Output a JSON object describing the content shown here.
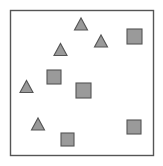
{
  "figure": {
    "title": "",
    "background_color": "#ffffff",
    "width": 163,
    "height": 166
  },
  "frame": {
    "name": "plot-border",
    "x": 10.5,
    "y": 10.5,
    "width": 143,
    "height": 145,
    "stroke_color": "#555555",
    "stroke_width": 1.4,
    "fill_color": "#ffffff"
  },
  "style": {
    "shape_fill": "#9a9a9a",
    "shape_stroke": "#555555",
    "shape_stroke_width": 1.1
  },
  "chart_data": {
    "type": "scatter",
    "title": "",
    "subtitle": "",
    "xlabel": "",
    "ylabel": "",
    "xlim": [
      10,
      154
    ],
    "ylim": [
      10,
      156
    ],
    "grid": false,
    "legend": "none",
    "axis_ticks": false,
    "axis_tick_labels": [],
    "annotations": [],
    "series": [
      {
        "name": "triangles",
        "marker": "triangle",
        "fill_color": "#9a9a9a",
        "edge_color": "#555555",
        "count": 5,
        "points": [
          {
            "id": "triangle-1",
            "cx": 81,
            "cy": 24,
            "size": 13
          },
          {
            "id": "triangle-2",
            "cx": 101,
            "cy": 41,
            "size": 13
          },
          {
            "id": "triangle-3",
            "cx": 60.5,
            "cy": 49.5,
            "size": 13
          },
          {
            "id": "triangle-4",
            "cx": 26.5,
            "cy": 86.5,
            "size": 13
          },
          {
            "id": "triangle-5",
            "cx": 38,
            "cy": 124,
            "size": 13
          }
        ]
      },
      {
        "name": "squares",
        "marker": "square",
        "fill_color": "#9a9a9a",
        "edge_color": "#555555",
        "count": 6,
        "points": [
          {
            "id": "square-1",
            "cx": 134.5,
            "cy": 36.5,
            "size": 15
          },
          {
            "id": "square-2",
            "cx": 54,
            "cy": 77,
            "size": 14
          },
          {
            "id": "square-3",
            "cx": 83.5,
            "cy": 90.5,
            "size": 15
          },
          {
            "id": "square-4",
            "cx": 134,
            "cy": 127,
            "size": 14
          },
          {
            "id": "square-5",
            "cx": 67.5,
            "cy": 139.5,
            "size": 13
          },
          {
            "id": "square-6",
            "cx": 83.5,
            "cy": 90.5,
            "size": 0
          }
        ]
      }
    ]
  }
}
